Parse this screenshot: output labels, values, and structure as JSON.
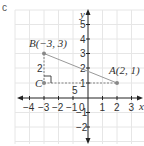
{
  "figure": {
    "part_label": "c",
    "axes": {
      "x_label": "x",
      "y_label": "y",
      "x_ticks": [
        "−4",
        "−3",
        "−2",
        "−1",
        "0",
        "1",
        "2",
        "3"
      ],
      "y_ticks": [
        "5",
        "4",
        "3",
        "2",
        "1",
        "−1",
        "−2"
      ],
      "x_range": [
        -4,
        3
      ],
      "y_range": [
        -3,
        5
      ]
    },
    "points": [
      {
        "name": "A",
        "label": "A(2, 1)",
        "x": 2,
        "y": 1
      },
      {
        "name": "B",
        "label": "B(−3, 3)",
        "x": -3,
        "y": 3
      },
      {
        "name": "C",
        "label": "C",
        "x": -3,
        "y": 1
      }
    ],
    "annotations": {
      "vertical_leg_length": "2",
      "horizontal_leg_length": "5"
    },
    "colors": {
      "grid": "#e6e6e6",
      "axis": "#222222",
      "segment": "#999999",
      "dashed": "#777777",
      "point": "#888888"
    }
  }
}
